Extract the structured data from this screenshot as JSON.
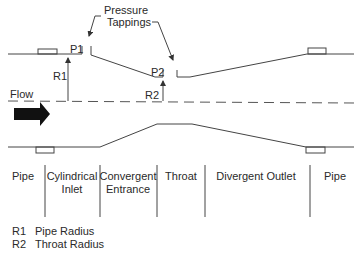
{
  "diagram": {
    "callout": {
      "line1": "Pressure",
      "line2": "Tappings"
    },
    "tapping_labels": {
      "p1": "P1",
      "p2": "P2"
    },
    "radius_labels": {
      "r1": "R1",
      "r2": "R2"
    },
    "flow_label": "Flow",
    "sections": [
      {
        "line1": "Pipe",
        "line2": ""
      },
      {
        "line1": "Cylindrical",
        "line2": "Inlet"
      },
      {
        "line1": "Convergent",
        "line2": "Entrance"
      },
      {
        "line1": "Throat",
        "line2": ""
      },
      {
        "line1": "Divergent Outlet",
        "line2": ""
      },
      {
        "line1": "Pipe",
        "line2": ""
      }
    ],
    "legend": [
      {
        "key": "R1",
        "text": "Pipe Radius"
      },
      {
        "key": "R2",
        "text": "Throat Radius"
      }
    ]
  }
}
